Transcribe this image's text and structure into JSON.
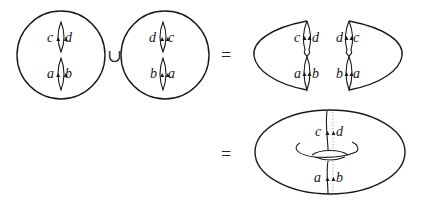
{
  "diagram": {
    "operators": {
      "union": "∪",
      "equals_1": "=",
      "equals_2": "="
    },
    "left_disk": {
      "top_slit": {
        "left": "c",
        "right": "d"
      },
      "bottom_slit": {
        "left": "a",
        "right": "b"
      }
    },
    "right_disk": {
      "top_slit": {
        "left": "d",
        "right": "c"
      },
      "bottom_slit": {
        "left": "b",
        "right": "a"
      }
    },
    "left_half": {
      "top": {
        "left": "c",
        "right": "d"
      },
      "bottom": {
        "left": "a",
        "right": "b"
      }
    },
    "right_half": {
      "top": {
        "left": "d",
        "right": "c"
      },
      "bottom": {
        "left": "b",
        "right": "a"
      }
    },
    "torus": {
      "top": {
        "left": "c",
        "right": "d"
      },
      "bottom": {
        "left": "a",
        "right": "b"
      }
    }
  }
}
